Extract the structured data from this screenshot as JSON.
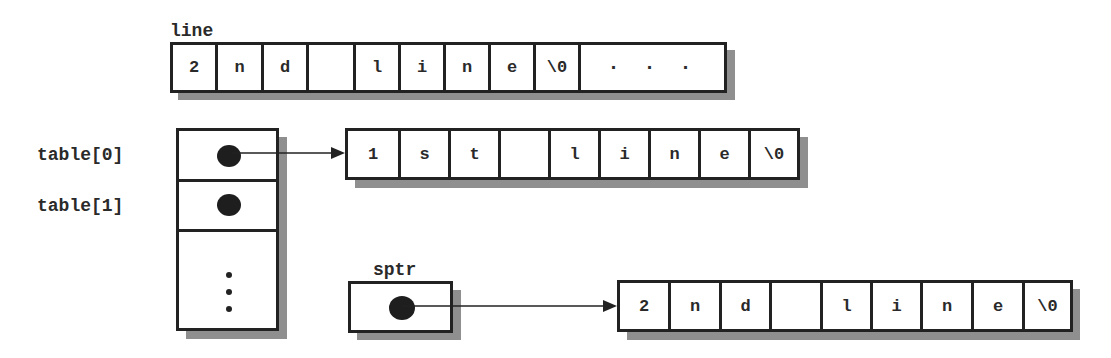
{
  "diagram": {
    "line": {
      "label": "line",
      "cells": [
        "2",
        "n",
        "d",
        "",
        "l",
        "i",
        "n",
        "e",
        "\\0"
      ],
      "overflow": "· · ·"
    },
    "table": {
      "labels": [
        "table[0]",
        "table[1]"
      ],
      "continuation": "vertical-ellipsis"
    },
    "first_line_array": {
      "cells": [
        "1",
        "s",
        "t",
        "",
        "l",
        "i",
        "n",
        "e",
        "\\0"
      ]
    },
    "sptr": {
      "label": "sptr"
    },
    "second_line_array": {
      "cells": [
        "2",
        "n",
        "d",
        "",
        "l",
        "i",
        "n",
        "e",
        "\\0"
      ]
    },
    "edges": [
      {
        "from": "table[0]",
        "to": "first_line_array"
      },
      {
        "from": "sptr",
        "to": "second_line_array"
      }
    ],
    "colors": {
      "stroke": "#222222",
      "shadow": "#8f8f8f",
      "pointer_dot": "#1e1e1e",
      "background": "#ffffff"
    }
  }
}
